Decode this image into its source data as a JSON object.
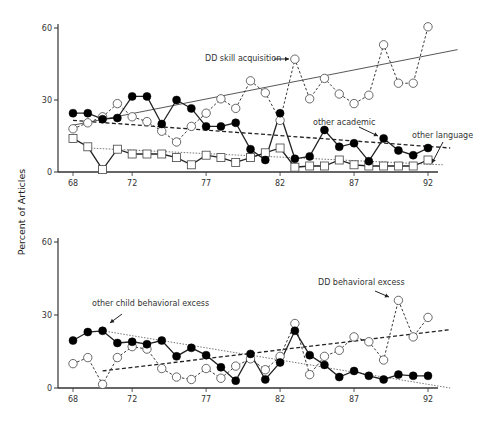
{
  "chart_data": [
    {
      "type": "line",
      "id": "top",
      "title": "",
      "xlabel": "",
      "ylabel": "Percent of Articles",
      "ylim": [
        0,
        60
      ],
      "xlim": [
        68,
        92
      ],
      "grid": false,
      "x": [
        68,
        69,
        70,
        71,
        72,
        73,
        74,
        75,
        76,
        77,
        78,
        79,
        80,
        81,
        82,
        83,
        84,
        85,
        86,
        87,
        88,
        89,
        90,
        91,
        92
      ],
      "xticks": [
        "68",
        "72",
        "77",
        "82",
        "87",
        "92"
      ],
      "xtick_values": [
        68,
        72,
        77,
        82,
        87,
        92
      ],
      "yticks": [
        "0",
        "30",
        "60"
      ],
      "ytick_values": [
        0,
        30,
        60
      ],
      "series": [
        {
          "name": "DD skill acquisition",
          "marker": "open-circle",
          "line": "dashed",
          "values": [
            18,
            20.5,
            23,
            28.5,
            23,
            21,
            17,
            12.5,
            19,
            24.5,
            30.5,
            26.5,
            38,
            33,
            21.5,
            47,
            30.5,
            39,
            32.5,
            28.5,
            32,
            53,
            37,
            37,
            60.5
          ],
          "trend": {
            "style": "solid",
            "from": [
              68,
              19.5
            ],
            "to": [
              94,
              51
            ]
          }
        },
        {
          "name": "other academic",
          "marker": "filled-circle",
          "line": "solid",
          "values": [
            24.5,
            24.5,
            22,
            22.5,
            31.5,
            31.5,
            20,
            30,
            26.5,
            19,
            19,
            20.5,
            9.5,
            5,
            24.5,
            5.5,
            6.5,
            17.5,
            10.5,
            12,
            4.5,
            14,
            9,
            7,
            10
          ],
          "trend": {
            "style": "dashed",
            "from": [
              68,
              21.5
            ],
            "to": [
              93.5,
              10
            ]
          }
        },
        {
          "name": "other language",
          "marker": "open-square",
          "line": "solid",
          "values": [
            14,
            10.5,
            1,
            9.5,
            7.5,
            7.5,
            7.5,
            6,
            3,
            7,
            6,
            4,
            6,
            8,
            10,
            2,
            2.5,
            2.5,
            5,
            3,
            2.5,
            2.5,
            2.5,
            2.5,
            5
          ],
          "trend": {
            "style": "dotted",
            "from": [
              69,
              10
            ],
            "to": [
              93,
              3
            ]
          }
        }
      ],
      "annotations": [
        {
          "text": "DD skill acquisition",
          "target_series": "DD skill acquisition",
          "target_x": 83
        },
        {
          "text": "other academic",
          "target_series": "other academic",
          "target_x": 89
        },
        {
          "text": "other language",
          "target_series": "other language",
          "target_x": 92
        }
      ]
    },
    {
      "type": "line",
      "id": "bottom",
      "title": "",
      "xlabel": "",
      "ylabel": "",
      "ylim": [
        0,
        60
      ],
      "xlim": [
        68,
        92
      ],
      "grid": false,
      "x": [
        68,
        69,
        70,
        71,
        72,
        73,
        74,
        75,
        76,
        77,
        78,
        79,
        80,
        81,
        82,
        83,
        84,
        85,
        86,
        87,
        88,
        89,
        90,
        91,
        92
      ],
      "xticks": [
        "68",
        "72",
        "77",
        "82",
        "87",
        "92"
      ],
      "xtick_values": [
        68,
        72,
        77,
        82,
        87,
        92
      ],
      "yticks": [
        "0",
        "30",
        "60"
      ],
      "ytick_values": [
        0,
        30,
        60
      ],
      "series": [
        {
          "name": "other child behavioral excess",
          "marker": "filled-circle",
          "line": "solid",
          "values": [
            19.5,
            23,
            23.5,
            18.5,
            19,
            18,
            19.5,
            13,
            16.5,
            13.5,
            8.5,
            3,
            14,
            3.5,
            10.5,
            23.5,
            13.5,
            9.5,
            4.5,
            7,
            5,
            3.5,
            5.5,
            5,
            5
          ],
          "trend": {
            "style": "dotted",
            "from": [
              70,
              23.5
            ],
            "to": [
              93.5,
              0
            ]
          }
        },
        {
          "name": "DD behavioral excess",
          "marker": "open-circle",
          "line": "dashed",
          "values": [
            10,
            12.5,
            1.5,
            12.5,
            17,
            16,
            8,
            4.5,
            3.5,
            8,
            4,
            9,
            12,
            7.5,
            13,
            26.5,
            5.5,
            13,
            15.5,
            21,
            19,
            11.5,
            36,
            21,
            29
          ],
          "trend": {
            "style": "dashed",
            "from": [
              70,
              7
            ],
            "to": [
              93.5,
              24
            ]
          }
        }
      ],
      "annotations": [
        {
          "text": "other child behavioral excess",
          "target_series": "other child behavioral excess",
          "target_x": 70
        },
        {
          "text": "DD behavioral excess",
          "target_series": "DD behavioral excess",
          "target_x": 90
        }
      ]
    }
  ],
  "shared_ylabel": "Percent of Articles"
}
